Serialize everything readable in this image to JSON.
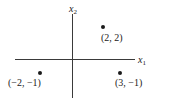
{
  "diagram": {
    "type": "coordinate-plane",
    "axes": {
      "x": {
        "name": "x",
        "subscript": "1"
      },
      "y": {
        "name": "x",
        "subscript": "2"
      }
    },
    "points": [
      {
        "label": "(2, 2)",
        "x": 2,
        "y": 2
      },
      {
        "label": "(−2, −1)",
        "x": -2,
        "y": -1
      },
      {
        "label": "(3, −1)",
        "x": 3,
        "y": -1
      }
    ],
    "colors": {
      "axis": "#3a3a3a",
      "point": "#1a1a1a",
      "text": "#222222"
    }
  }
}
